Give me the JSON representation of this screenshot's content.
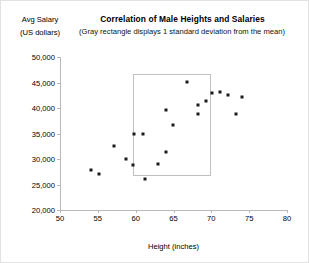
{
  "chart_data": {
    "type": "scatter",
    "title": "Correlation of Male Heights and Salaries",
    "subtitle": "(Gray rectangle displays 1 standard deviation from the mean)",
    "xlabel": "Height (inches)",
    "ylabel_line1": "Avg Salary",
    "ylabel_line2": "(US dollars)",
    "xlim": [
      50,
      80
    ],
    "ylim": [
      20000,
      50000
    ],
    "xticks": [
      50,
      55,
      60,
      65,
      70,
      75,
      80
    ],
    "xtick_labels": [
      "50",
      "55",
      "60",
      "65",
      "70",
      "75",
      "80"
    ],
    "yticks": [
      20000,
      25000,
      30000,
      35000,
      40000,
      45000,
      50000
    ],
    "ytick_labels": [
      "20,000",
      "25,000",
      "30,000",
      "35,000",
      "40,000",
      "45,000",
      "50,000"
    ],
    "grid": false,
    "legend": false,
    "marker_color": "#1a1a1a",
    "axis_color": "#b9b9b9",
    "sd_rect": {
      "label": "1 standard deviation from the mean",
      "x0": 59.6,
      "x1": 69.9,
      "y0": 26650,
      "y1": 46700,
      "border_color": "#c0c0c0"
    },
    "points": [
      {
        "x": 54.1,
        "y": 27900
      },
      {
        "x": 55.1,
        "y": 27100
      },
      {
        "x": 57.1,
        "y": 32600
      },
      {
        "x": 58.7,
        "y": 30000
      },
      {
        "x": 59.6,
        "y": 28900
      },
      {
        "x": 59.8,
        "y": 34900
      },
      {
        "x": 61.0,
        "y": 34900
      },
      {
        "x": 61.2,
        "y": 26000
      },
      {
        "x": 62.9,
        "y": 29000
      },
      {
        "x": 64.0,
        "y": 31300
      },
      {
        "x": 64.9,
        "y": 36600
      },
      {
        "x": 66.8,
        "y": 45100
      },
      {
        "x": 64.0,
        "y": 39600
      },
      {
        "x": 68.2,
        "y": 40500
      },
      {
        "x": 69.3,
        "y": 41300
      },
      {
        "x": 70.1,
        "y": 42900
      },
      {
        "x": 71.2,
        "y": 43100
      },
      {
        "x": 72.2,
        "y": 42500
      },
      {
        "x": 73.3,
        "y": 38800
      },
      {
        "x": 74.0,
        "y": 42100
      },
      {
        "x": 68.2,
        "y": 38800
      }
    ]
  }
}
